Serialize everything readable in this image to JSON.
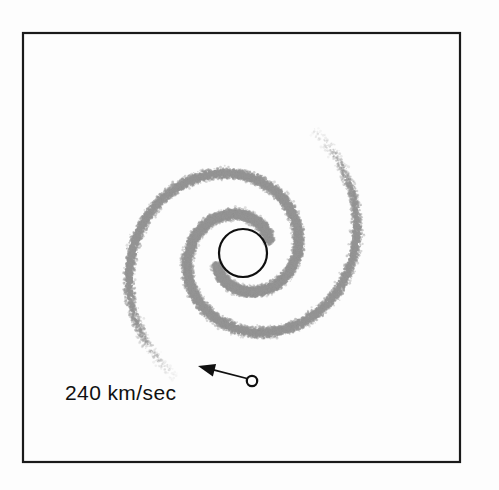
{
  "figure": {
    "kind": "spiral-galaxy-rotation-diagram",
    "background_color": "#fdfdfd",
    "frame": {
      "name": "plot-border",
      "x": 23,
      "y": 33,
      "width": 437,
      "height": 429,
      "stroke_color": "#1a1a1a",
      "stroke_width": 2.2
    },
    "nucleus": {
      "label": "galactic-nucleus",
      "cx": 243,
      "cy": 253,
      "r": 24,
      "stroke_color": "#101010",
      "stroke_width": 2.2,
      "fill": "none"
    },
    "sun": {
      "label": "sun-marker",
      "cx": 252,
      "cy": 381,
      "r": 5.2,
      "stroke_color": "#101010",
      "stroke_width": 2.2,
      "fill": "#ffffff"
    },
    "velocity_arrow": {
      "label": "velocity-vector",
      "from_x": 249,
      "from_y": 379,
      "to_x": 198,
      "to_y": 366,
      "stroke_color": "#101010",
      "stroke_width": 1.8,
      "head_length": 17,
      "head_width": 13
    },
    "velocity_label": {
      "text": "240 km/sec",
      "x": 65,
      "y": 400,
      "font_size": 21,
      "color": "#101010"
    },
    "spiral_arms": {
      "color": "#949494",
      "stipple_density": 0.72,
      "band_half_width": 7.5,
      "arm_count": 2,
      "geometry": {
        "center_x": 243,
        "center_y": 253,
        "a": 26.5,
        "b": 0.228,
        "theta_start": 0.35,
        "theta_end": 7.35,
        "arm_phase_offsets_deg": [
          0,
          180
        ]
      }
    }
  },
  "chart_data": {
    "type": "scatter",
    "title": "",
    "xlabel": "",
    "ylabel": "",
    "annotations": [
      {
        "name": "galactic-nucleus",
        "kind": "circle",
        "x": 243,
        "y": 253,
        "r": 24
      },
      {
        "name": "sun-position",
        "kind": "circle",
        "x": 252,
        "y": 381,
        "r": 5.2
      },
      {
        "name": "orbital-velocity-arrow",
        "kind": "arrow",
        "x1": 249,
        "y1": 379,
        "x2": 198,
        "y2": 366,
        "text": "240 km/sec"
      }
    ],
    "series": [
      {
        "name": "spiral-arm-1",
        "kind": "log-spiral",
        "a": 26.5,
        "b": 0.228,
        "phase_deg": 0,
        "theta_range": [
          0.35,
          7.35
        ]
      },
      {
        "name": "spiral-arm-2",
        "kind": "log-spiral",
        "a": 26.5,
        "b": 0.228,
        "phase_deg": 180,
        "theta_range": [
          0.35,
          7.35
        ]
      }
    ],
    "legend": [],
    "grid": false
  }
}
